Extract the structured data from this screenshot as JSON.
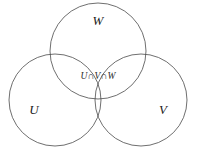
{
  "figure": {
    "kind": "venn-diagram",
    "background_color": "#ffffff",
    "stroke_color": "#4a4a4a",
    "label_color": "#1a1a1a"
  },
  "sets": [
    {
      "id": "w",
      "label": "W",
      "label_x": 98,
      "label_y": 22,
      "cx": 98,
      "cy": 51,
      "r": 48
    },
    {
      "id": "u",
      "label": "U",
      "label_x": 34,
      "label_y": 111,
      "cx": 55,
      "cy": 100,
      "r": 46
    },
    {
      "id": "v",
      "label": "V",
      "label_x": 163,
      "label_y": 111,
      "cx": 141,
      "cy": 100,
      "r": 46
    }
  ],
  "regions": [
    {
      "id": "triple-intersection",
      "label": "U∩V∩W",
      "label_x": 98,
      "label_y": 77
    }
  ]
}
